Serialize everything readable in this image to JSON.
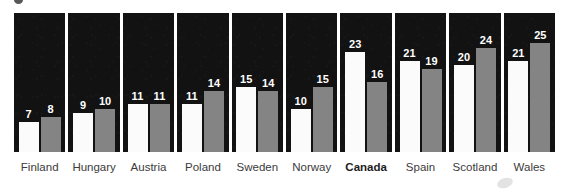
{
  "chart_data": {
    "type": "bar",
    "title": "",
    "subtitle": "",
    "xlabel": "",
    "ylabel": "",
    "ylim": [
      0,
      29
    ],
    "grid": false,
    "legend_position": "none",
    "orientation": "vertical",
    "categories": [
      "Finland",
      "Hungary",
      "Austria",
      "Poland",
      "Sweden",
      "Norway",
      "Canada",
      "Spain",
      "Scotland",
      "Wales"
    ],
    "highlight_category": "Canada",
    "series": [
      {
        "name": "series-a",
        "color": "#fbfbfb",
        "values": [
          7,
          9,
          11,
          11,
          15,
          10,
          23,
          21,
          20,
          21
        ]
      },
      {
        "name": "series-b",
        "color": "#848484",
        "values": [
          8,
          10,
          11,
          14,
          14,
          15,
          16,
          19,
          24,
          25
        ]
      }
    ],
    "value_labels": [
      [
        "7",
        "8"
      ],
      [
        "9",
        "10"
      ],
      [
        "11",
        "11"
      ],
      [
        "11",
        "14"
      ],
      [
        "15",
        "14"
      ],
      [
        "10",
        "15"
      ],
      [
        "23",
        "16"
      ],
      [
        "21",
        "19"
      ],
      [
        "20",
        "24"
      ],
      [
        "21",
        "25"
      ]
    ],
    "panel_background": "#121212",
    "label_color": "#3b3b3b",
    "value_label_color": "#ffffff"
  }
}
